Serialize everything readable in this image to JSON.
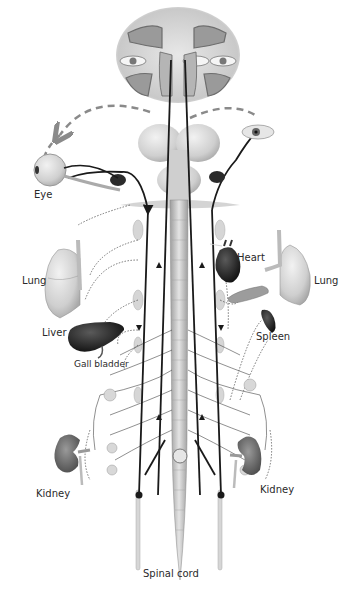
{
  "diagram": {
    "type": "anatomical-illustration",
    "labels": {
      "eye_left": "Eye",
      "lung_left": "Lung",
      "liver": "Liver",
      "gall_bladder": "Gall bladder",
      "kidney_left": "Kidney",
      "heart": "Heart",
      "lung_right": "Lung",
      "spleen": "Spleen",
      "kidney_right": "Kidney",
      "spinal_cord": "Spinal cord"
    },
    "colors": {
      "nerve_line": "#1a1a1a",
      "dashed_arrow": "#8a8a8a",
      "organ_light": "#d8d8d8",
      "organ_dark": "#2b2b2b",
      "spinal_cord": "#c8c8c8",
      "background": "#ffffff"
    }
  }
}
